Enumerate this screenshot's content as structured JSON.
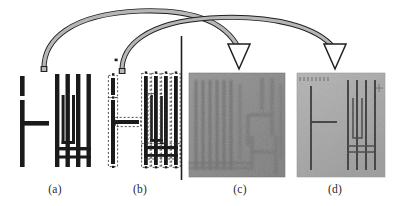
{
  "figure": {
    "background_color": "#ffffff",
    "panel_count": 4
  },
  "captions": {
    "a": "(a)",
    "b": "(b)",
    "c": "(c)",
    "d": "(d)"
  },
  "panels": [
    {
      "id": "a",
      "label": "(a)",
      "kind": "layout-drawing",
      "description": "Uncorrected binary mask layout: T-shaped bar at left and interdigitated comb of four vertical fingers at right",
      "ink_color": "#1a1a1a",
      "background_color": "#ffffff"
    },
    {
      "id": "b",
      "label": "(b)",
      "kind": "layout-drawing",
      "description": "Proximity-corrected / fractured layout: same shapes overlaid with dashed dose-assignment sub-shapes",
      "ink_color": "#1a1a1a",
      "outline_color": "#3a3a3a",
      "background_color": "#ffffff"
    },
    {
      "id": "c",
      "label": "(c)",
      "kind": "sem-micrograph",
      "description": "Scanning electron micrograph of pattern exposed without correction; features blurred and merged",
      "background_color": "#8a8a8a",
      "feature_color": "#6b6b6b"
    },
    {
      "id": "d",
      "label": "(d)",
      "kind": "sem-micrograph",
      "description": "Scanning electron micrograph of pattern exposed with correction; features sharp and resolved",
      "background_color": "#a9a9a9",
      "feature_color": "#3c3c3c"
    }
  ],
  "arrows": [
    {
      "id": "arrow-a-to-c",
      "from": "a",
      "to": "c",
      "style": "curved-ribbon",
      "fill_color": "#b3b3b3",
      "stroke_color": "#1f1f1f",
      "head": "hollow-triangle"
    },
    {
      "id": "arrow-b-to-d",
      "from": "b",
      "to": "d",
      "style": "curved-ribbon",
      "fill_color": "#b3b3b3",
      "stroke_color": "#1f1f1f",
      "head": "hollow-triangle"
    }
  ],
  "divider": {
    "id": "design-vs-sem-divider",
    "orientation": "vertical",
    "color": "#1f1f1f",
    "x": 181,
    "y_top": 36,
    "y_bottom": 180
  },
  "colors": {
    "ink": "#1a1a1a",
    "arrow_fill": "#b3b3b3",
    "arrow_stroke": "#1f1f1f",
    "sem_c_bg": "#8a8a8a",
    "sem_d_bg": "#a9a9a9",
    "page_bg": "#ffffff",
    "caption_text": "#2a2a2a"
  }
}
